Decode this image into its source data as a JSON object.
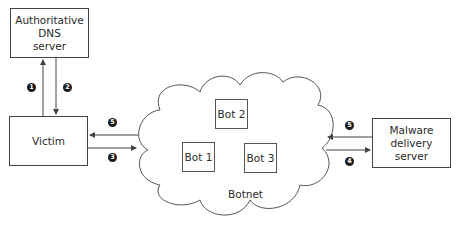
{
  "diagram": {
    "nodes": {
      "dns_server": {
        "lines": [
          "Authoritative",
          "DNS",
          "server"
        ]
      },
      "victim": {
        "label": "Victim"
      },
      "malware_server": {
        "lines": [
          "Malware",
          "delivery",
          "server"
        ]
      },
      "botnet": {
        "label": "Botnet",
        "bots": [
          {
            "id": "bot2",
            "label": "Bot 2"
          },
          {
            "id": "bot1",
            "label": "Bot 1"
          },
          {
            "id": "bot3",
            "label": "Bot 3"
          }
        ]
      }
    },
    "steps": {
      "s1": "1",
      "s2": "2",
      "s3": "3",
      "s4": "4",
      "s5a": "5",
      "s5b": "5"
    },
    "edges": [
      {
        "step": "1",
        "from": "Victim",
        "to": "Authoritative DNS server"
      },
      {
        "step": "2",
        "from": "Authoritative DNS server",
        "to": "Victim"
      },
      {
        "step": "3",
        "from": "Victim",
        "to": "Botnet"
      },
      {
        "step": "4",
        "from": "Botnet",
        "to": "Malware delivery server"
      },
      {
        "step": "5",
        "from": "Malware delivery server",
        "to": "Botnet"
      },
      {
        "step": "5",
        "from": "Botnet",
        "to": "Victim"
      }
    ],
    "colors": {
      "stroke": "#444444",
      "badge": "#1a1a1a",
      "background": "#ffffff"
    }
  }
}
